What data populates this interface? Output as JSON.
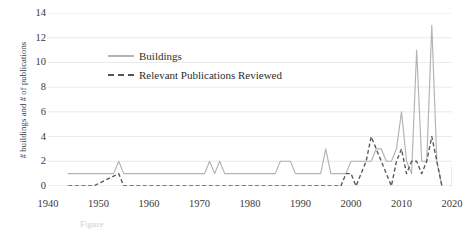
{
  "chart_data": {
    "type": "line",
    "title": "",
    "xlabel": "",
    "ylabel": "# buildings  and # of publications",
    "xlim": [
      1940,
      2020
    ],
    "ylim": [
      0,
      14
    ],
    "yticks": [
      0,
      2,
      4,
      6,
      8,
      10,
      12,
      14
    ],
    "xticks": [
      1940,
      1950,
      1960,
      1970,
      1980,
      1990,
      2000,
      2010,
      2020
    ],
    "grid": true,
    "legend_position": "upper-left-inside",
    "series": [
      {
        "name": "Buildings",
        "style": "solid",
        "color": "#b3b3b3",
        "x": [
          1944,
          1945,
          1946,
          1947,
          1948,
          1949,
          1950,
          1951,
          1952,
          1953,
          1954,
          1955,
          1956,
          1957,
          1958,
          1959,
          1960,
          1961,
          1962,
          1963,
          1964,
          1965,
          1966,
          1967,
          1968,
          1969,
          1970,
          1971,
          1972,
          1973,
          1974,
          1975,
          1976,
          1977,
          1978,
          1979,
          1980,
          1981,
          1982,
          1983,
          1984,
          1985,
          1986,
          1987,
          1988,
          1989,
          1990,
          1991,
          1992,
          1993,
          1994,
          1995,
          1996,
          1997,
          1998,
          1999,
          2000,
          2001,
          2002,
          2003,
          2004,
          2005,
          2006,
          2007,
          2008,
          2009,
          2010,
          2011,
          2012,
          2013,
          2014,
          2015,
          2016,
          2017,
          2018
        ],
        "values": [
          1,
          1,
          1,
          1,
          1,
          1,
          1,
          1,
          1,
          1,
          2,
          1,
          1,
          1,
          1,
          1,
          1,
          1,
          1,
          1,
          1,
          1,
          1,
          1,
          1,
          1,
          1,
          1,
          2,
          1,
          2,
          1,
          1,
          1,
          1,
          1,
          1,
          1,
          1,
          1,
          1,
          1,
          2,
          2,
          2,
          1,
          1,
          1,
          1,
          1,
          1,
          3,
          1,
          1,
          1,
          1,
          2,
          2,
          2,
          2,
          2,
          3,
          3,
          2,
          2,
          3,
          6,
          2,
          1,
          11,
          2,
          2,
          13,
          2,
          0
        ]
      },
      {
        "name": "Relevant Publications Reviewed",
        "style": "dashed",
        "color": "#555555",
        "x": [
          1944,
          1945,
          1946,
          1947,
          1948,
          1949,
          1950,
          1951,
          1952,
          1953,
          1954,
          1955,
          1956,
          1957,
          1958,
          1959,
          1960,
          1961,
          1962,
          1963,
          1964,
          1965,
          1966,
          1967,
          1968,
          1969,
          1970,
          1971,
          1972,
          1973,
          1974,
          1975,
          1976,
          1977,
          1978,
          1979,
          1980,
          1981,
          1982,
          1983,
          1984,
          1985,
          1986,
          1987,
          1988,
          1989,
          1990,
          1991,
          1992,
          1993,
          1994,
          1995,
          1996,
          1997,
          1998,
          1999,
          2000,
          2001,
          2002,
          2003,
          2004,
          2005,
          2006,
          2007,
          2008,
          2009,
          2010,
          2011,
          2012,
          2013,
          2014,
          2015,
          2016,
          2017,
          2018
        ],
        "values": [
          0,
          0,
          0,
          0,
          0,
          0,
          0.2,
          0.4,
          0.6,
          0.8,
          1,
          0,
          0,
          0,
          0,
          0,
          0,
          0,
          0,
          0,
          0,
          0,
          0,
          0,
          0,
          0,
          0,
          0,
          0,
          0,
          0,
          0,
          0,
          0,
          0,
          0,
          0,
          0,
          0,
          0,
          0,
          0,
          0,
          0,
          0,
          0,
          0,
          0,
          0,
          0,
          0,
          0,
          0,
          0,
          0,
          1,
          1,
          0,
          1,
          2,
          4,
          3,
          2,
          1,
          0,
          2,
          3,
          1,
          2,
          2,
          1,
          2,
          4,
          2,
          0
        ]
      }
    ]
  },
  "legend": {
    "items": [
      {
        "label": "Buildings",
        "style": "solid"
      },
      {
        "label": "Relevant Publications Reviewed",
        "style": "dashed"
      }
    ]
  },
  "axes": {
    "y_title": "# buildings  and # of publications",
    "y_tick_labels": [
      "14",
      "12",
      "10",
      "8",
      "6",
      "4",
      "2",
      "0"
    ],
    "x_tick_labels": [
      "1940",
      "1950",
      "1960",
      "1970",
      "1980",
      "1990",
      "2000",
      "2010",
      "2020"
    ]
  },
  "caption": "Figure"
}
